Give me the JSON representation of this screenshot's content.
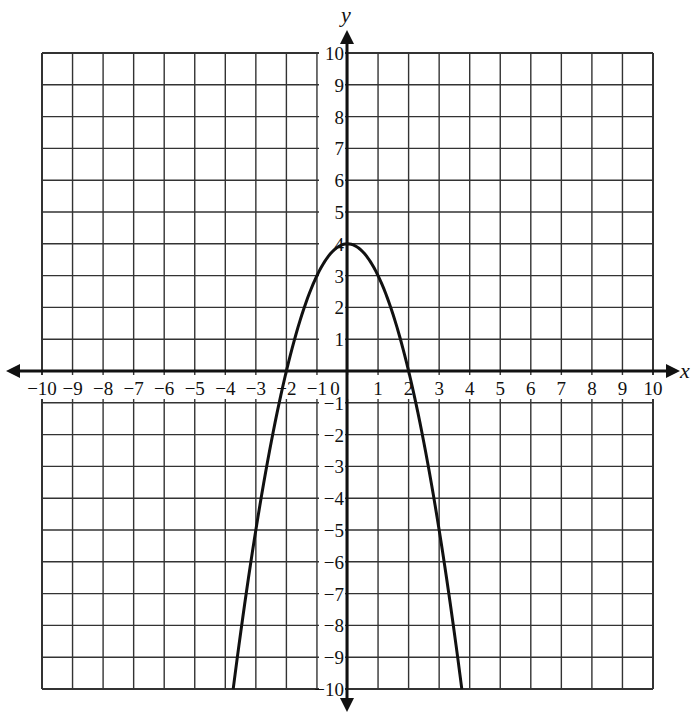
{
  "chart_data": {
    "type": "line",
    "title": "",
    "xlabel": "x",
    "ylabel": "y",
    "xlim": [
      -10,
      10
    ],
    "ylim": [
      -10,
      10
    ],
    "grid": true,
    "x_ticks": [
      -10,
      -9,
      -8,
      -7,
      -6,
      -5,
      -4,
      -3,
      -2,
      -1,
      0,
      1,
      2,
      3,
      4,
      5,
      6,
      7,
      8,
      9,
      10
    ],
    "y_ticks": [
      -10,
      -9,
      -8,
      -7,
      -6,
      -5,
      -4,
      -3,
      -2,
      -1,
      1,
      2,
      3,
      4,
      5,
      6,
      7,
      8,
      9,
      10
    ],
    "x_tick_labels": [
      "−10",
      "−9",
      "−8",
      "−7",
      "−6",
      "−5",
      "−4",
      "−3",
      "−2",
      "−1",
      "0",
      "1",
      "2",
      "3",
      "4",
      "5",
      "6",
      "7",
      "8",
      "9",
      "10"
    ],
    "y_tick_labels": [
      "−10",
      "−9",
      "−8",
      "−7",
      "−6",
      "−5",
      "−4",
      "−3",
      "−2",
      "−1",
      "1",
      "2",
      "3",
      "4",
      "5",
      "6",
      "7",
      "8",
      "9",
      "10"
    ],
    "series": [
      {
        "name": "y = 4 − x²",
        "equation": "y = -x^2 + 4",
        "vertex": [
          0,
          4
        ],
        "x_intercepts": [
          -2,
          2
        ],
        "y_intercept": 4,
        "domain_shown": [
          -3.742,
          3.742
        ],
        "points": [
          [
            -3.742,
            -10
          ],
          [
            -3.5,
            -8.25
          ],
          [
            -3,
            -5
          ],
          [
            -2.5,
            -2.25
          ],
          [
            -2,
            0
          ],
          [
            -1.5,
            1.75
          ],
          [
            -1,
            3
          ],
          [
            -0.5,
            3.75
          ],
          [
            0,
            4
          ],
          [
            0.5,
            3.75
          ],
          [
            1,
            3
          ],
          [
            1.5,
            1.75
          ],
          [
            2,
            0
          ],
          [
            2.5,
            -2.25
          ],
          [
            3,
            -5
          ],
          [
            3.5,
            -8.25
          ],
          [
            3.742,
            -10
          ]
        ]
      }
    ],
    "colors": {
      "line": "#111111",
      "grid": "#333333",
      "background": "#ffffff"
    }
  },
  "axes": {
    "x_label": "x",
    "y_label": "y",
    "origin_label": "0"
  }
}
